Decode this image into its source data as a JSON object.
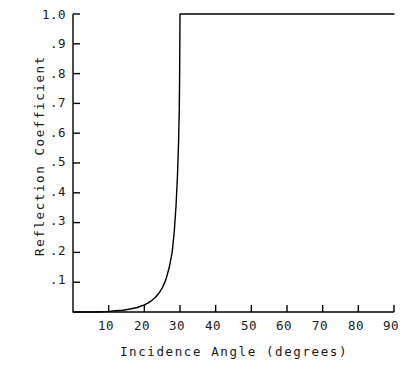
{
  "chart_data": {
    "type": "line",
    "title": "",
    "subtitle": "",
    "xlabel": "Incidence Angle (degrees)",
    "ylabel": "Reflection Coefficient",
    "xlim": [
      0,
      90
    ],
    "ylim": [
      0,
      1.0
    ],
    "grid": false,
    "legend": null,
    "xticks": [
      0,
      10,
      20,
      30,
      40,
      50,
      60,
      70,
      80,
      90
    ],
    "xtick_labels": [
      "",
      "10",
      "20",
      "30",
      "40",
      "50",
      "60",
      "70",
      "80",
      "90"
    ],
    "yticks": [
      0,
      0.1,
      0.2,
      0.3,
      0.4,
      0.5,
      0.6,
      0.7,
      0.8,
      0.9,
      1.0
    ],
    "ytick_labels": [
      "",
      ".1",
      ".2",
      ".3",
      ".4",
      ".5",
      ".6",
      ".7",
      ".8",
      ".9",
      "1.0"
    ],
    "annotations": [],
    "line_color": "#000000",
    "axis_color": "#000000",
    "background_color": "#ffffff",
    "series": [
      {
        "name": "Reflection Coefficient",
        "x": [
          0,
          2,
          4,
          6,
          8,
          10,
          12,
          14,
          16,
          18,
          20,
          21,
          22,
          23,
          24,
          25,
          26,
          27,
          27.8,
          28.4,
          28.9,
          29.3,
          29.6,
          29.8,
          29.9,
          30,
          35,
          40,
          45,
          50,
          55,
          60,
          65,
          70,
          75,
          80,
          85,
          90
        ],
        "y": [
          0.0,
          0.0,
          0.0,
          0.0,
          0.001,
          0.002,
          0.004,
          0.006,
          0.01,
          0.015,
          0.024,
          0.03,
          0.038,
          0.048,
          0.062,
          0.08,
          0.107,
          0.15,
          0.2,
          0.27,
          0.36,
          0.46,
          0.57,
          0.68,
          0.8,
          1.0,
          1.0,
          1.0,
          1.0,
          1.0,
          1.0,
          1.0,
          1.0,
          1.0,
          1.0,
          1.0,
          1.0,
          1.0
        ]
      }
    ]
  },
  "axes": {
    "critical_angle_label": "30"
  }
}
